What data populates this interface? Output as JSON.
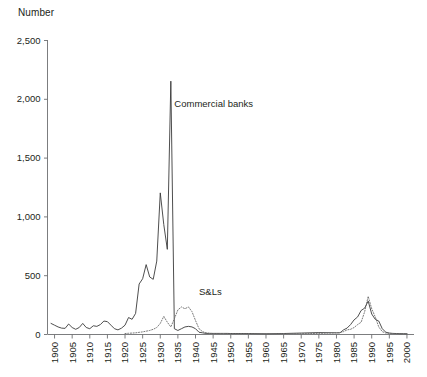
{
  "chart_data": {
    "type": "line",
    "title": "",
    "ylabel": "Number",
    "xlabel": "",
    "ylim": [
      0,
      2500
    ],
    "xlim": [
      1898,
      2002
    ],
    "grid": false,
    "legend_position": "inline-annotation",
    "y_ticks": [
      0,
      500,
      1000,
      1500,
      2000,
      2500
    ],
    "y_tick_labels": [
      "0",
      "500",
      "1,000",
      "1,500",
      "2,000",
      "2,500"
    ],
    "x_ticks": [
      1900,
      1905,
      1910,
      1915,
      1920,
      1925,
      1930,
      1935,
      1940,
      1945,
      1950,
      1955,
      1960,
      1965,
      1970,
      1975,
      1980,
      1985,
      1990,
      1995,
      2000
    ],
    "x_tick_labels": [
      "1900",
      "1905",
      "1910",
      "1915",
      "1920",
      "1925",
      "1930",
      "1935",
      "1940",
      "1945",
      "1950",
      "1955",
      "1960",
      "1965",
      "1970",
      "1975",
      "1980",
      "1985",
      "1990",
      "1995",
      "2000"
    ],
    "annotations": [
      {
        "text": "Commercial banks",
        "x": 1934,
        "y": 1930
      },
      {
        "text": "S&Ls",
        "x": 1941,
        "y": 330
      }
    ],
    "series": [
      {
        "name": "Commercial banks",
        "style": "solid",
        "color": "#3a3a3a",
        "x": [
          1899,
          1900,
          1901,
          1902,
          1903,
          1904,
          1905,
          1906,
          1907,
          1908,
          1909,
          1910,
          1911,
          1912,
          1913,
          1914,
          1915,
          1916,
          1917,
          1918,
          1919,
          1920,
          1921,
          1922,
          1923,
          1924,
          1925,
          1926,
          1927,
          1928,
          1929,
          1930,
          1931,
          1932,
          1933,
          1934,
          1935,
          1936,
          1937,
          1938,
          1939,
          1940,
          1941,
          1942,
          1943,
          1944,
          1945,
          1946,
          1947,
          1948,
          1949,
          1950,
          1955,
          1960,
          1965,
          1970,
          1975,
          1980,
          1981,
          1982,
          1983,
          1984,
          1985,
          1986,
          1987,
          1988,
          1989,
          1990,
          1991,
          1992,
          1993,
          1994,
          1995,
          1996,
          1997,
          1998,
          1999,
          2000
        ],
        "values": [
          90,
          75,
          60,
          50,
          48,
          85,
          55,
          40,
          55,
          90,
          55,
          45,
          70,
          65,
          80,
          110,
          105,
          75,
          45,
          35,
          50,
          75,
          140,
          125,
          175,
          425,
          470,
          590,
          485,
          465,
          620,
          1200,
          930,
          720,
          2150,
          45,
          30,
          45,
          60,
          65,
          60,
          45,
          15,
          10,
          5,
          5,
          5,
          5,
          5,
          5,
          5,
          4,
          4,
          2,
          4,
          8,
          12,
          10,
          10,
          35,
          50,
          80,
          120,
          145,
          200,
          220,
          280,
          170,
          125,
          110,
          45,
          15,
          8,
          5,
          4,
          3,
          3,
          2
        ]
      },
      {
        "name": "S&Ls",
        "style": "dotted",
        "color": "#6b6b6b",
        "x": [
          1920,
          1921,
          1922,
          1923,
          1924,
          1925,
          1926,
          1927,
          1928,
          1929,
          1930,
          1931,
          1932,
          1933,
          1934,
          1935,
          1936,
          1937,
          1938,
          1939,
          1940,
          1941,
          1942,
          1943,
          1944,
          1945,
          1950,
          1955,
          1960,
          1965,
          1970,
          1975,
          1980,
          1981,
          1982,
          1983,
          1984,
          1985,
          1986,
          1987,
          1988,
          1989,
          1990,
          1991,
          1992,
          1993,
          1994,
          1995,
          1996,
          1997,
          2000
        ],
        "values": [
          4,
          6,
          8,
          10,
          14,
          18,
          24,
          30,
          40,
          55,
          90,
          150,
          100,
          60,
          130,
          205,
          230,
          215,
          230,
          190,
          115,
          45,
          20,
          10,
          6,
          4,
          3,
          2,
          2,
          2,
          3,
          5,
          10,
          12,
          20,
          35,
          40,
          55,
          80,
          100,
          190,
          320,
          215,
          145,
          60,
          20,
          8,
          5,
          3,
          2,
          2
        ]
      }
    ]
  }
}
